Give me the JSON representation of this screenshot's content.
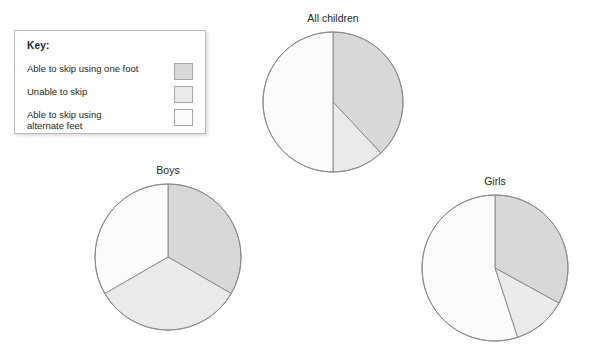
{
  "key": {
    "title": "Key:",
    "items": [
      {
        "label": "Able to skip using one foot",
        "color": "#d8d8d8"
      },
      {
        "label": "Unable to skip",
        "color": "#eaeaea"
      },
      {
        "label": "Able to skip using\nalternate feet",
        "color": "#fbfbfb"
      }
    ]
  },
  "charts": [
    {
      "title": "All children",
      "center_x": 333,
      "center_y": 102,
      "radius": 70
    },
    {
      "title": "Boys",
      "center_x": 168,
      "center_y": 257,
      "radius": 73
    },
    {
      "title": "Girls",
      "center_x": 495,
      "center_y": 268,
      "radius": 73
    }
  ],
  "chart_data": [
    {
      "type": "pie",
      "title": "All children",
      "categories": [
        "Able to skip using one foot",
        "Unable to skip",
        "Able to skip using alternate feet"
      ],
      "values": [
        38,
        12,
        50
      ],
      "colors": [
        "#d8d8d8",
        "#eaeaea",
        "#fbfbfb"
      ],
      "start_angle": 0,
      "legend": "Key box, top left",
      "notes": "Slice boundaries at 12 o'clock, approx 137 degrees (lower-left diagonal) and approx 180 degrees (straight down)."
    },
    {
      "type": "pie",
      "title": "Boys",
      "categories": [
        "Able to skip using one foot",
        "Unable to skip",
        "Able to skip using alternate feet"
      ],
      "values": [
        33.3,
        33.3,
        33.3
      ],
      "colors": [
        "#d8d8d8",
        "#eaeaea",
        "#fbfbfb"
      ],
      "start_angle": 0,
      "legend": "Key box, top left",
      "notes": "Three equal thirds, boundaries at 12 o'clock, 120 degrees and 240 degrees."
    },
    {
      "type": "pie",
      "title": "Girls",
      "categories": [
        "Able to skip using one foot",
        "Unable to skip",
        "Able to skip using alternate feet"
      ],
      "values": [
        33,
        12,
        55
      ],
      "colors": [
        "#d8d8d8",
        "#eaeaea",
        "#fbfbfb"
      ],
      "start_angle": 0,
      "legend": "Key box, top left",
      "notes": "Slice boundaries at 12 o'clock, approx 215 degrees (lower-left diagonal) and approx 192 degrees."
    }
  ]
}
